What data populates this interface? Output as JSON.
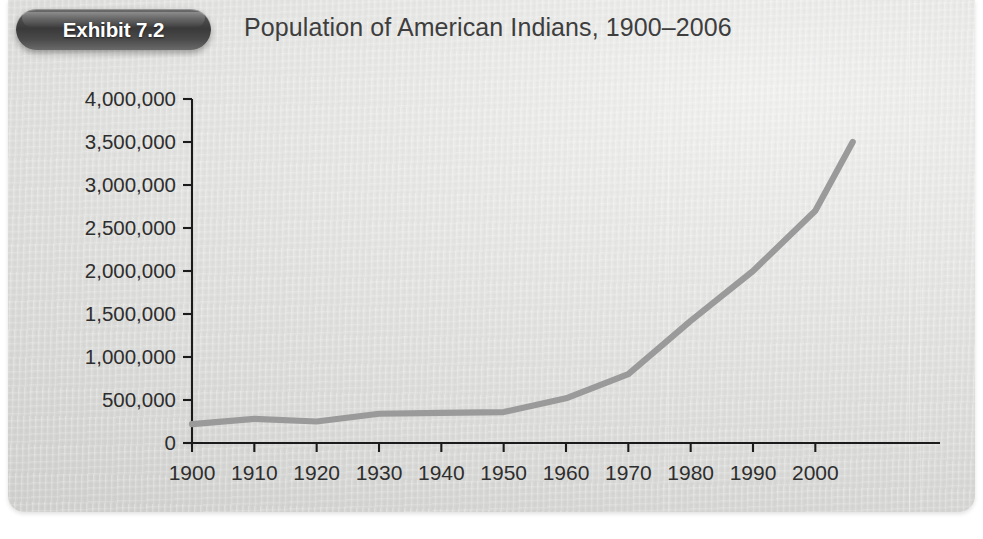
{
  "exhibit": {
    "badge_label": "Exhibit 7.2",
    "title": "Population of American Indians, 1900–2006"
  },
  "colors": {
    "panel_background": "#e3e3e1",
    "badge_background": "#3a3a3a",
    "badge_text": "#ffffff",
    "title_text": "#3e3e3e",
    "axis": "#1b1b1b",
    "series_line": "#9a9a9a"
  },
  "chart_data": {
    "type": "line",
    "title": "Population of American Indians, 1900–2006",
    "xlabel": "",
    "ylabel": "",
    "x": [
      1900,
      1910,
      1920,
      1930,
      1940,
      1950,
      1960,
      1970,
      1980,
      1990,
      2000,
      2006
    ],
    "values": [
      220000,
      280000,
      250000,
      340000,
      350000,
      360000,
      520000,
      800000,
      1420000,
      2000000,
      2700000,
      3500000
    ],
    "series": [
      {
        "name": "Population of American Indians",
        "color": "#9a9a9a",
        "values": [
          220000,
          280000,
          250000,
          340000,
          350000,
          360000,
          520000,
          800000,
          1420000,
          2000000,
          2700000,
          3500000
        ]
      }
    ],
    "xlim": [
      1900,
      2006
    ],
    "ylim": [
      0,
      4000000
    ],
    "xticks": [
      1900,
      1910,
      1920,
      1930,
      1940,
      1950,
      1960,
      1970,
      1980,
      1990,
      2000
    ],
    "xtick_labels": [
      "1900",
      "1910",
      "1920",
      "1930",
      "1940",
      "1950",
      "1960",
      "1970",
      "1980",
      "1990",
      "2000"
    ],
    "yticks": [
      0,
      500000,
      1000000,
      1500000,
      2000000,
      2500000,
      3000000,
      3500000,
      4000000
    ],
    "ytick_labels": [
      "0",
      "500,000",
      "1,000,000",
      "1,500,000",
      "2,000,000",
      "2,500,000",
      "3,000,000",
      "3,500,000",
      "4,000,000"
    ],
    "grid": false,
    "legend": false,
    "legend_position": "none"
  }
}
